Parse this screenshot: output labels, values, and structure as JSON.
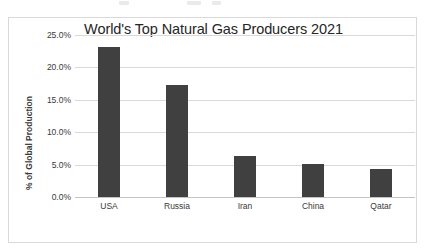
{
  "chart_data": {
    "type": "bar",
    "title": "World's Top Natural Gas Producers 2021",
    "xlabel": "",
    "ylabel": "% of Global Production",
    "categories": [
      "USA",
      "Russia",
      "Iran",
      "China",
      "Qatar"
    ],
    "values": [
      23.1,
      17.3,
      6.3,
      5.1,
      4.3
    ],
    "ylim": [
      0,
      25
    ],
    "ytick_labels": [
      "25.0%",
      "20.0%",
      "15.0%",
      "10.0%",
      "5.0%",
      "0.0%"
    ],
    "ytick_values": [
      25,
      20,
      15,
      10,
      5,
      0
    ],
    "grid": true,
    "legend": false,
    "bar_color": "#404040",
    "grid_color": "#d9d9d9",
    "text_color": "#3a3a3a",
    "title_color": "#262626",
    "plot_border_color": "#d9d9d9",
    "background": "#ffffff"
  }
}
